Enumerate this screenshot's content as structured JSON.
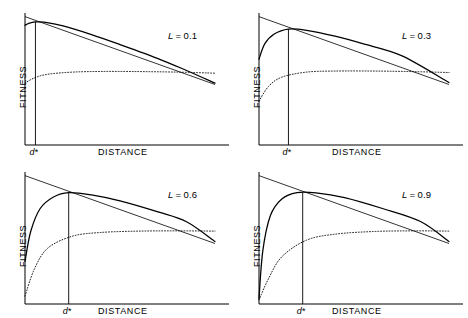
{
  "figure": {
    "type": "multi-panel-line-chart",
    "panel_count": 4,
    "axis_labels": {
      "x": "DISTANCE",
      "y": "FITNESS"
    },
    "optimum_marker_label": "d*",
    "line_color": "#000000",
    "background": "#ffffff"
  },
  "chart_data": {
    "type": "line",
    "title": "",
    "xlabel": "DISTANCE",
    "ylabel": "FITNESS",
    "xlim": [
      0,
      1
    ],
    "ylim": [
      0,
      1
    ],
    "grid": false,
    "legend_position": "none",
    "panel_parameter_name": "L",
    "annotations": [
      "d*"
    ],
    "panels": [
      {
        "label": "L = 0.1",
        "param": "L",
        "value": 0.1,
        "d_star": 0.055,
        "series": [
          {
            "name": "straight-line",
            "style": "solid-thin",
            "x": [
              0.0,
              1.0
            ],
            "y": [
              0.965,
              0.455
            ]
          },
          {
            "name": "fitness-curve",
            "style": "solid",
            "x": [
              0.0,
              0.02,
              0.055,
              0.1,
              0.2,
              0.35,
              0.5,
              0.7,
              0.85,
              1.0
            ],
            "y": [
              0.9,
              0.915,
              0.925,
              0.923,
              0.895,
              0.83,
              0.755,
              0.65,
              0.56,
              0.465
            ]
          },
          {
            "name": "dotted-curve",
            "style": "dotted",
            "x": [
              0.0,
              0.05,
              0.12,
              0.25,
              0.4,
              0.6,
              0.8,
              1.0
            ],
            "y": [
              0.465,
              0.505,
              0.532,
              0.548,
              0.553,
              0.552,
              0.548,
              0.54
            ]
          }
        ]
      },
      {
        "label": "L = 0.3",
        "param": "L",
        "value": 0.3,
        "d_star": 0.155,
        "series": [
          {
            "name": "straight-line",
            "style": "solid-thin",
            "x": [
              0.0,
              1.0
            ],
            "y": [
              0.965,
              0.455
            ]
          },
          {
            "name": "fitness-curve",
            "style": "solid",
            "x": [
              0.0,
              0.03,
              0.08,
              0.155,
              0.25,
              0.4,
              0.55,
              0.75,
              1.0
            ],
            "y": [
              0.645,
              0.76,
              0.835,
              0.872,
              0.862,
              0.818,
              0.76,
              0.672,
              0.47
            ]
          },
          {
            "name": "dotted-curve",
            "style": "dotted",
            "x": [
              0.0,
              0.05,
              0.12,
              0.25,
              0.4,
              0.6,
              0.8,
              1.0
            ],
            "y": [
              0.33,
              0.44,
              0.51,
              0.548,
              0.556,
              0.556,
              0.552,
              0.545
            ]
          }
        ]
      },
      {
        "label": "L = 0.6",
        "param": "L",
        "value": 0.6,
        "d_star": 0.23,
        "series": [
          {
            "name": "straight-line",
            "style": "solid-thin",
            "x": [
              0.0,
              1.0
            ],
            "y": [
              0.965,
              0.455
            ]
          },
          {
            "name": "fitness-curve",
            "style": "solid",
            "x": [
              0.0,
              0.03,
              0.08,
              0.15,
              0.23,
              0.35,
              0.5,
              0.7,
              0.85,
              1.0
            ],
            "y": [
              0.32,
              0.545,
              0.718,
              0.805,
              0.838,
              0.82,
              0.775,
              0.692,
              0.618,
              0.47
            ]
          },
          {
            "name": "dotted-curve",
            "style": "dotted",
            "x": [
              0.0,
              0.05,
              0.12,
              0.25,
              0.4,
              0.6,
              0.8,
              1.0
            ],
            "y": [
              0.06,
              0.265,
              0.42,
              0.51,
              0.538,
              0.548,
              0.55,
              0.548
            ]
          }
        ]
      },
      {
        "label": "L = 0.9",
        "param": "L",
        "value": 0.9,
        "d_star": 0.23,
        "series": [
          {
            "name": "straight-line",
            "style": "solid-thin",
            "x": [
              0.0,
              1.0
            ],
            "y": [
              0.965,
              0.455
            ]
          },
          {
            "name": "fitness-curve",
            "style": "solid",
            "x": [
              0.0,
              0.02,
              0.06,
              0.12,
              0.2,
              0.3,
              0.45,
              0.65,
              0.85,
              1.0
            ],
            "y": [
              0.04,
              0.4,
              0.665,
              0.79,
              0.838,
              0.836,
              0.8,
              0.718,
              0.62,
              0.47
            ]
          },
          {
            "name": "dotted-curve",
            "style": "dotted",
            "x": [
              0.0,
              0.05,
              0.12,
              0.25,
              0.4,
              0.6,
              0.8,
              1.0
            ],
            "y": [
              0.03,
              0.19,
              0.355,
              0.48,
              0.525,
              0.545,
              0.55,
              0.548
            ]
          }
        ]
      }
    ]
  }
}
